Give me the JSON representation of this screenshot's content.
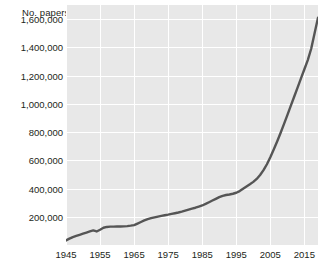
{
  "chart_data": {
    "type": "line",
    "title": "",
    "ylabel": "No. papers",
    "xlabel": "",
    "xlim": [
      1945,
      2019
    ],
    "ylim": [
      0,
      1700000
    ],
    "grid": true,
    "legend": "none",
    "line_color": "#555555",
    "plot_background": "#e8e8e8",
    "gridline_color": "#ffffff",
    "yticks": [
      200000,
      400000,
      600000,
      800000,
      1000000,
      1200000,
      1400000,
      1600000
    ],
    "ytick_labels": [
      "200,000",
      "400,000",
      "600,000",
      "800,000",
      "1,000,000",
      "1,200,000",
      "1,400,000",
      "1,600,000"
    ],
    "xticks": [
      1945,
      1955,
      1965,
      1975,
      1985,
      1995,
      2005,
      2015
    ],
    "xtick_labels": [
      "1945",
      "1955",
      "1965",
      "1975",
      "1985",
      "1995",
      "2005",
      "2015"
    ],
    "series": [
      {
        "name": "No. papers",
        "x": [
          1945,
          1946,
          1947,
          1948,
          1949,
          1950,
          1951,
          1952,
          1953,
          1954,
          1955,
          1956,
          1957,
          1958,
          1959,
          1960,
          1961,
          1962,
          1963,
          1964,
          1965,
          1966,
          1967,
          1968,
          1969,
          1970,
          1971,
          1972,
          1973,
          1974,
          1975,
          1976,
          1977,
          1978,
          1979,
          1980,
          1981,
          1982,
          1983,
          1984,
          1985,
          1986,
          1987,
          1988,
          1989,
          1990,
          1991,
          1992,
          1993,
          1994,
          1995,
          1996,
          1997,
          1998,
          1999,
          2000,
          2001,
          2002,
          2003,
          2004,
          2005,
          2006,
          2007,
          2008,
          2009,
          2010,
          2011,
          2012,
          2013,
          2014,
          2015,
          2016,
          2017,
          2018,
          2019
        ],
        "y": [
          32000,
          45000,
          56000,
          64000,
          72000,
          80000,
          88000,
          96000,
          103000,
          96000,
          108000,
          122000,
          128000,
          130000,
          130000,
          131000,
          131000,
          132000,
          134000,
          137000,
          141000,
          152000,
          163000,
          174000,
          183000,
          190000,
          196000,
          201000,
          206000,
          211000,
          215000,
          220000,
          225000,
          230000,
          236000,
          243000,
          250000,
          257000,
          264000,
          272000,
          280000,
          291000,
          303000,
          315000,
          327000,
          339000,
          348000,
          354000,
          358000,
          363000,
          370000,
          382000,
          398000,
          414000,
          430000,
          447000,
          468000,
          496000,
          530000,
          572000,
          622000,
          676000,
          733000,
          793000,
          856000,
          920000,
          985000,
          1050000,
          1115000,
          1180000,
          1245000,
          1310000,
          1390000,
          1500000,
          1610000
        ]
      }
    ]
  }
}
